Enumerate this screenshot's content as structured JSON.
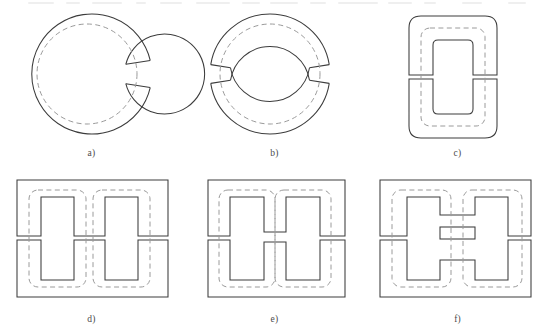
{
  "document": {
    "type": "technical-diagram",
    "title": "Magnetic core shapes and air-gap configurations",
    "background_color": "#ffffff",
    "line_color": "#3c3c3c",
    "flux_line_color": "#9a9a9a",
    "label_color": "#4b4b4b",
    "rows": 2,
    "columns": 3
  },
  "figures": [
    {
      "id": "a",
      "label": "a)",
      "shape": "toroidal-ring",
      "description": "Circular ring core with a single radial air gap on the right side",
      "gap_count": 1,
      "gap_positions": [
        "right"
      ],
      "flux_path": "dashed circular centerline",
      "geometry": {
        "center_x": 80,
        "center_y": 68,
        "outer_radius": 60,
        "inner_radius": 40,
        "mean_radius": 50,
        "gap_angle_deg": 14
      }
    },
    {
      "id": "b",
      "label": "b)",
      "shape": "toroidal-ring-split",
      "description": "Circular ring core split into two C halves with two radial air gaps, left and right",
      "gap_count": 2,
      "gap_positions": [
        "left",
        "right"
      ],
      "flux_path": "dashed circular centerline",
      "geometry": {
        "center_x": 80,
        "center_y": 68,
        "outer_radius": 60,
        "inner_radius": 40,
        "mean_radius": 50,
        "gap_angle_deg": 9
      }
    },
    {
      "id": "c",
      "label": "c)",
      "shape": "cc-core",
      "description": "Rounded rectangular C-core split horizontally into two halves, gaps in both legs",
      "gap_count": 2,
      "gap_positions": [
        "left-leg",
        "right-leg"
      ],
      "flux_path": "dashed rounded rectangular loop",
      "geometry": {
        "outer_x": 26,
        "outer_y": 10,
        "outer_width": 88,
        "outer_height": 122,
        "outer_corner_radius": 12,
        "window_x": 50,
        "window_y": 34,
        "window_width": 40,
        "window_height": 74,
        "window_corner_radius": 5,
        "split_y": 71,
        "gap_height": 4
      }
    },
    {
      "id": "d",
      "label": "d)",
      "shape": "ee-core",
      "description": "Double-window E-core split horizontally across full width, gaps in all three legs",
      "gap_count": 3,
      "gap_positions": [
        "left-leg",
        "center-leg",
        "right-leg"
      ],
      "flux_path": "two dashed rounded rectangular loops, one per window",
      "geometry": {
        "outer_x": 17,
        "outer_y": 8,
        "outer_width": 151,
        "outer_height": 117,
        "window_top": 25,
        "window_bottom": 108,
        "window_left_x": 41,
        "window_right_x": 105,
        "window_width": 33,
        "split_y": 66,
        "gap_height": 3
      }
    },
    {
      "id": "e",
      "label": "e)",
      "shape": "ei-core-h-window",
      "description": "Core with H-shaped center section, windows joined by a single center bar, gaps only in the outer legs",
      "gap_count": 2,
      "gap_positions": [
        "left-leg",
        "right-leg"
      ],
      "center_bars": 1,
      "flux_path": "two dashed rounded rectangular loops, one per window",
      "geometry": {
        "outer_x": 25,
        "outer_y": 8,
        "outer_width": 137,
        "outer_height": 117,
        "window_top": 25,
        "window_bottom": 108,
        "window_left_x": 47,
        "window_right_x": 103,
        "window_width": 34,
        "center_bar_top": 60,
        "center_bar_bottom": 70,
        "split_y": 66
      }
    },
    {
      "id": "f",
      "label": "f)",
      "shape": "ei-core-multi-gap",
      "description": "Core with H-shaped center section containing multiple stacked horizontal bars forming two thin distributed centre gaps, plus gaps in the outer legs",
      "gap_count": 4,
      "gap_positions": [
        "left-leg",
        "center-upper",
        "center-lower",
        "right-leg"
      ],
      "center_bars": 3,
      "flux_path": "two dashed rounded rectangular loops, one per window",
      "geometry": {
        "outer_x": 14,
        "outer_y": 8,
        "outer_width": 151,
        "outer_height": 117,
        "window_top": 25,
        "window_bottom": 108,
        "window_left_x": 41,
        "window_right_x": 109,
        "window_width": 33,
        "center_slot_tops": [
          43,
          64
        ],
        "center_slot_height": 12,
        "split_y": 66
      }
    }
  ]
}
